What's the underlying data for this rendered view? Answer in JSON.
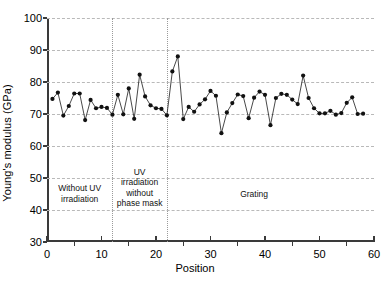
{
  "chart_data": {
    "type": "line",
    "title": "",
    "xlabel": "Position",
    "ylabel": "Young's modulus (GPa)",
    "xlim": [
      0,
      60
    ],
    "ylim": [
      30,
      100
    ],
    "grid": true,
    "legend": "none",
    "marker": "filled-circle",
    "y_ticks": [
      30,
      40,
      50,
      60,
      70,
      80,
      90,
      100
    ],
    "x_ticks": [
      0,
      10,
      20,
      30,
      40,
      50,
      60
    ],
    "x_minor_ticks": [
      5,
      15,
      25,
      35,
      45,
      55
    ],
    "dividers": [
      12,
      22
    ],
    "regions": [
      {
        "name": "without-uv-irradiation",
        "label": "Without UV\nirradiation",
        "x": 6,
        "y": 45
      },
      {
        "name": "uv-irradiation-without-phase-mask",
        "label": "UV\nirradiation\nwithout\nphase mask",
        "x": 17,
        "y": 47
      },
      {
        "name": "grating",
        "label": "Grating",
        "x": 38,
        "y": 45
      }
    ],
    "x": [
      1.0,
      2.0,
      3.0,
      4.0,
      5.0,
      6.0,
      7.0,
      8.0,
      9.0,
      10.0,
      11.0,
      12.0,
      13.0,
      14.0,
      15.0,
      16.0,
      17.0,
      18.0,
      19.0,
      20.0,
      21.0,
      22.0,
      23.0,
      24.0,
      25.0,
      26.0,
      27.0,
      28.0,
      29.0,
      30.0,
      31.0,
      32.0,
      33.0,
      34.0,
      35.0,
      36.0,
      37.0,
      38.0,
      39.0,
      40.0,
      41.0,
      42.0,
      43.0,
      44.0,
      45.0,
      46.0,
      47.0,
      48.0,
      49.0,
      50.0,
      51.0,
      52.0,
      53.0,
      54.0,
      55.0,
      56.0,
      57.0,
      58.0
    ],
    "values": [
      74.7,
      76.7,
      69.5,
      72.5,
      76.4,
      76.4,
      68.1,
      74.4,
      71.8,
      72.2,
      71.9,
      69.8,
      76.0,
      69.9,
      78.0,
      68.5,
      82.3,
      75.5,
      72.7,
      71.8,
      71.6,
      69.6,
      83.3,
      88.0,
      68.4,
      72.2,
      70.7,
      73.0,
      74.6,
      77.2,
      75.7,
      64.0,
      70.5,
      73.4,
      76.1,
      75.6,
      68.7,
      75.1,
      77.0,
      76.0,
      66.5,
      75.0,
      76.3,
      76.0,
      74.5,
      73.1,
      82.0,
      75.0,
      71.8,
      70.2,
      70.2,
      71.0,
      69.8,
      70.3,
      73.5,
      75.2,
      70.0,
      70.1
    ],
    "series_name": "Young's modulus"
  }
}
